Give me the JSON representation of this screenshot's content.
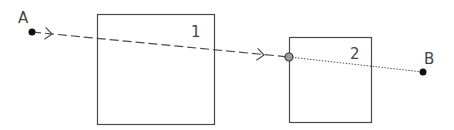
{
  "diagram": {
    "title": "",
    "points": {
      "A": {
        "label": "A",
        "x": 32,
        "y": 32
      },
      "B": {
        "label": "B",
        "x": 423,
        "y": 72
      },
      "junction": {
        "x": 289,
        "y": 57
      }
    },
    "boxes": [
      {
        "id": "1",
        "label": "1",
        "x": 97,
        "y": 14,
        "width": 117,
        "height": 110
      },
      {
        "id": "2",
        "label": "2",
        "x": 289,
        "y": 37,
        "width": 82,
        "height": 85
      }
    ],
    "segments": [
      {
        "from": "A",
        "to": "junction",
        "style": "dashed",
        "arrows": [
          {
            "x": 52,
            "y": 34
          },
          {
            "x": 264,
            "y": 55
          }
        ]
      },
      {
        "from": "junction",
        "to": "B",
        "style": "dotted"
      }
    ],
    "colors": {
      "stroke": "#4a4a4a",
      "point": "#111111",
      "junction_fill": "#9a9a9a",
      "text": "#444444"
    }
  }
}
